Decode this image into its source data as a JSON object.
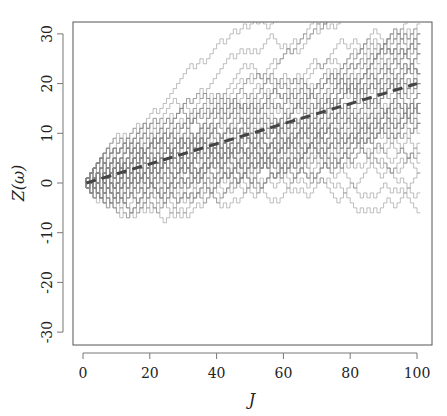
{
  "chart_data": {
    "type": "line",
    "title": "",
    "xlabel": "J",
    "ylabel": "Z(ω)",
    "xlim": [
      0,
      100
    ],
    "ylim": [
      -32,
      32
    ],
    "x_ticks": [
      "0",
      "20",
      "40",
      "60",
      "80",
      "100"
    ],
    "y_ticks": [
      "-30",
      "-20",
      "-10",
      "0",
      "10",
      "20",
      "30"
    ],
    "grid": false,
    "legend": null,
    "series": [
      {
        "name": "random walk paths (many, gray step lines)",
        "description": "Ensemble of +/-1 step random walks starting at 0 for J=1..100, spreading from about [-3,3] near J=0 to roughly [-5,32] at J=100",
        "envelope_upper": [
          [
            0,
            2
          ],
          [
            20,
            15
          ],
          [
            40,
            25
          ],
          [
            60,
            28
          ],
          [
            70,
            32
          ],
          [
            100,
            32
          ]
        ],
        "envelope_lower": [
          [
            0,
            -3
          ],
          [
            20,
            -5
          ],
          [
            40,
            -10
          ],
          [
            60,
            -8
          ],
          [
            80,
            -6
          ],
          [
            100,
            -5
          ]
        ]
      },
      {
        "name": "mean drift (dashed)",
        "x": [
          0,
          100
        ],
        "values": [
          0,
          20
        ],
        "style": "dashed",
        "color": "#444444"
      }
    ]
  }
}
